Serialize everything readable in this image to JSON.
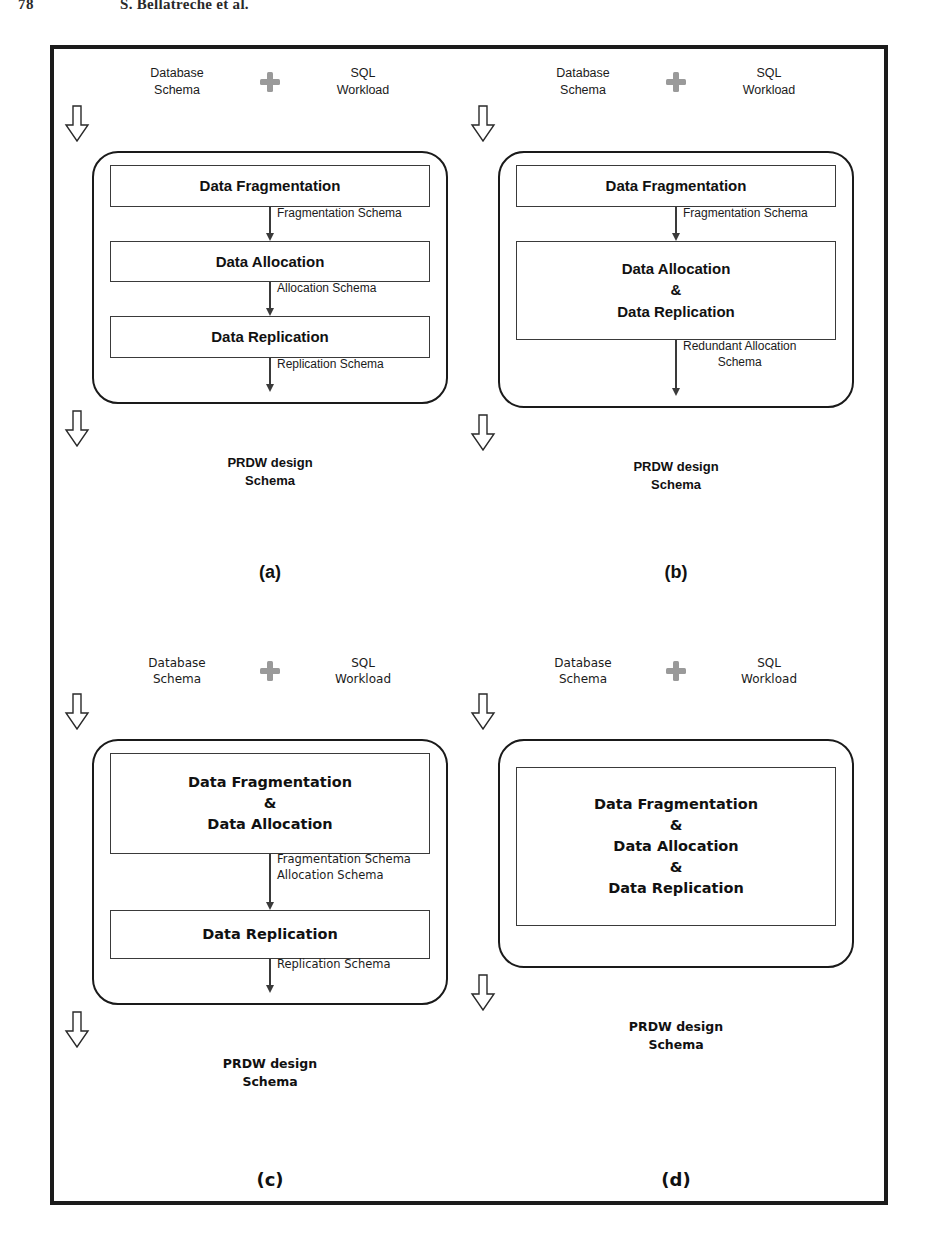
{
  "running_head": {
    "folio": "78",
    "authors": "S. Bellatreche et al."
  },
  "figure": {
    "inputs": {
      "left_label": "Database\nSchema",
      "plus_icon": "plus-icon",
      "right_label": "SQL\nWorkload",
      "input_arrow_icon": "hollow-down-arrow-icon"
    },
    "output": {
      "label": "PRDW design\nSchema",
      "output_arrow_icon": "hollow-down-arrow-icon"
    },
    "panels": [
      {
        "id": "a",
        "caption": "(a)",
        "inputs": {
          "left_label": "Database\nSchema",
          "right_label": "SQL\nWorkload"
        },
        "steps": [
          {
            "label": "Data Fragmentation"
          },
          {
            "label": "Data Allocation"
          },
          {
            "label": "Data Replication"
          }
        ],
        "connectors": [
          {
            "label": "Fragmentation Schema"
          },
          {
            "label": "Allocation Schema"
          },
          {
            "label": "Replication Schema"
          }
        ],
        "output_label": "PRDW design\nSchema"
      },
      {
        "id": "b",
        "caption": "(b)",
        "inputs": {
          "left_label": "Database\nSchema",
          "right_label": "SQL\nWorkload"
        },
        "steps": [
          {
            "label": "Data Fragmentation"
          },
          {
            "label": "Data Allocation",
            "amp": "&",
            "label2": "Data Replication"
          }
        ],
        "connectors": [
          {
            "label": "Fragmentation Schema"
          },
          {
            "label": "Redundant Allocation\nSchema"
          }
        ],
        "output_label": "PRDW design\nSchema"
      },
      {
        "id": "c",
        "caption": "(c)",
        "inputs": {
          "left_label": "Database\nSchema",
          "right_label": "SQL\nWorkload"
        },
        "steps": [
          {
            "label": "Data Fragmentation",
            "amp": "&",
            "label2": "Data Allocation"
          },
          {
            "label": "Data Replication"
          }
        ],
        "connectors": [
          {
            "label": "Fragmentation Schema\nAllocation Schema"
          },
          {
            "label": "Replication Schema"
          }
        ],
        "output_label": "PRDW design\nSchema"
      },
      {
        "id": "d",
        "caption": "(d)",
        "inputs": {
          "left_label": "Database\nSchema",
          "right_label": "SQL\nWorkload"
        },
        "steps": [
          {
            "label": "Data Fragmentation",
            "amp": "&",
            "label2": "Data Allocation",
            "amp2": "&",
            "label3": "Data Replication"
          }
        ],
        "connectors": [],
        "output_label": "PRDW design\nSchema"
      }
    ]
  },
  "colors": {
    "frame_border": "#1b1b1b",
    "box_border": "#3a3a3a",
    "container_border": "#1a1a1a",
    "plus_icon": "#9a9a9a",
    "text": "#111111",
    "page_background": "#ffffff"
  }
}
